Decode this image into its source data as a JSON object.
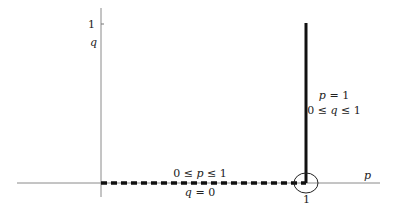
{
  "diagram": {
    "axes": {
      "x_label": "p",
      "y_label": "q",
      "x_tick_label": "1",
      "y_tick_label": "1"
    },
    "vertical_segment": {
      "line1": "p = 1",
      "line2": "0 ≤ q ≤ 1"
    },
    "horizontal_segment": {
      "line1": "0 ≤ p ≤ 1",
      "line2": "q = 0"
    },
    "colors": {
      "axis": "#888888",
      "segment": "#111111"
    }
  }
}
